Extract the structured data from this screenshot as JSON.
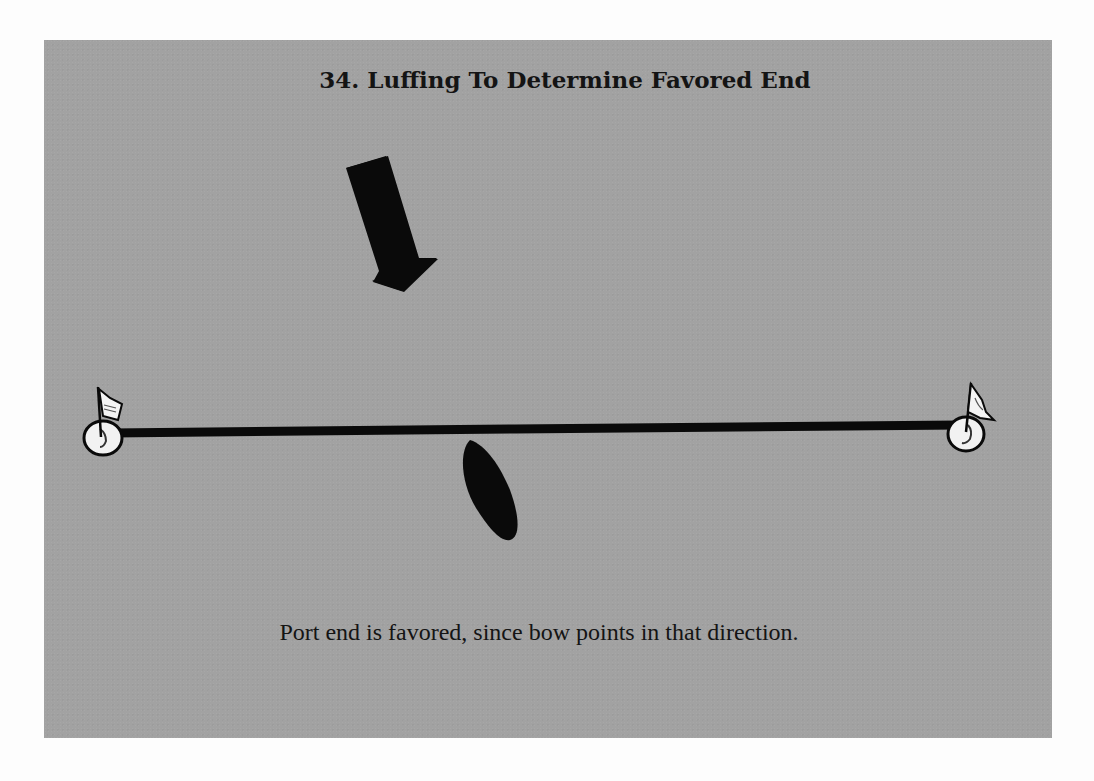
{
  "figure": {
    "title": "34. Luffing To Determine Favored End",
    "caption": "Port end is favored, since bow points in that direction.",
    "number": "34"
  },
  "diagram": {
    "wind_arrow": {
      "label": "wind-direction",
      "direction": "down-right"
    },
    "start_line": {
      "description": "starting line between two marks"
    },
    "marks": [
      {
        "id": "port-mark",
        "side": "left",
        "type": "buoy with flag"
      },
      {
        "id": "starboard-mark",
        "side": "right",
        "type": "buoy with flag"
      }
    ],
    "boat": {
      "state": "luffing head to wind",
      "bow_points": "port end"
    }
  },
  "colors": {
    "panel_background": "#a2a2a2",
    "page_background": "#fdfdfd",
    "ink": "#0a0a0a",
    "mark_fill": "#f2f2f2"
  }
}
